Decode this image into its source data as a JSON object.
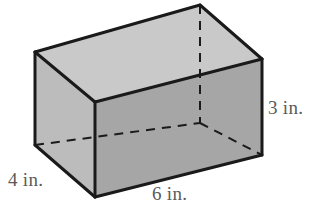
{
  "figure": {
    "type": "rectangular-prism",
    "shape_name": "rectangular prism",
    "title": "",
    "unit": "in.",
    "dimensions": {
      "width": "6 in.",
      "depth": "4 in.",
      "height": "3 in."
    },
    "colors": {
      "top_face": "#c9c9c9",
      "left_face": "#bcbcbc",
      "front_face": "#a6a6a6",
      "edge_visible": "#1a1a1a",
      "edge_hidden": "#1a1a1a",
      "background": "#ffffff",
      "label_text": "#5a5a5a"
    },
    "vertices": {
      "back_top_left": [
        35,
        52
      ],
      "back_top_right": [
        200,
        5
      ],
      "front_top_left": [
        95,
        102
      ],
      "front_top_right": [
        262,
        59
      ],
      "back_bottom_left": [
        35,
        145
      ],
      "back_bottom_right": [
        200,
        123
      ],
      "front_bottom_left": [
        95,
        197
      ],
      "front_bottom_right": [
        262,
        155
      ]
    },
    "hidden_edges": [
      "back_top_right-to-back_bottom_right",
      "back_bottom_left-to-back_bottom_right",
      "back_bottom_right-to-front_bottom_right"
    ]
  },
  "labels": {
    "height": "3 in.",
    "depth": "4 in.",
    "width": "6 in."
  }
}
